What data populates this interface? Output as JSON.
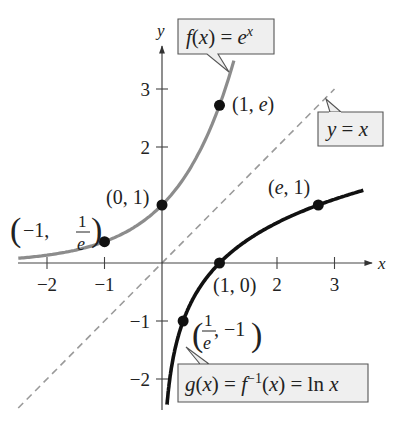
{
  "chart_data": {
    "type": "line",
    "title": "",
    "xlabel": "x",
    "ylabel": "y",
    "xlim": [
      -2.5,
      3.7
    ],
    "ylim": [
      -2.5,
      3.6
    ],
    "x_ticks": [
      {
        "value": -2,
        "label": "−2"
      },
      {
        "value": -1,
        "label": "−1"
      },
      {
        "value": 2,
        "label": "2"
      },
      {
        "value": 3,
        "label": "3"
      }
    ],
    "y_ticks": [
      {
        "value": 3,
        "label": "3"
      },
      {
        "value": 2,
        "label": "2"
      },
      {
        "value": -1,
        "label": "−1"
      },
      {
        "value": -2,
        "label": "−2"
      }
    ],
    "grid": false,
    "series": [
      {
        "name": "f(x) = e^x",
        "function": "exp",
        "domain": [
          -2.5,
          1.25
        ],
        "color": "#8c8c8c",
        "style": "solid",
        "label": {
          "pre": "f(x) = e",
          "sup": "x"
        }
      },
      {
        "name": "g(x) = f^-1(x) = ln x",
        "function": "ln",
        "domain": [
          0.087,
          3.5
        ],
        "color": "#111111",
        "style": "solid",
        "label": {
          "a": "g(x) = f",
          "sup": "−1",
          "b": "(x) = ln x"
        }
      },
      {
        "name": "y = x",
        "function": "identity",
        "domain": [
          -2.5,
          3.0
        ],
        "color": "#9a9a9a",
        "style": "dashed",
        "label": {
          "text": "y = x"
        }
      }
    ],
    "points": [
      {
        "x": -1,
        "y": 0.3679,
        "label": "(−1, 1/e)"
      },
      {
        "x": 0,
        "y": 1,
        "label": "(0, 1)"
      },
      {
        "x": 1,
        "y": 2.7183,
        "label": "(1, e)"
      },
      {
        "x": 1,
        "y": 0,
        "label": "(1, 0)"
      },
      {
        "x": 2.7183,
        "y": 1,
        "label": "(e, 1)"
      },
      {
        "x": 0.3679,
        "y": -1,
        "label": "(1/e, −1)"
      }
    ],
    "text": {
      "p_neg1": {
        "a": "−1,",
        "num": "1",
        "den": "e"
      },
      "p_01": "(0, 1)",
      "p_1e": "(1, e)",
      "p_10": "(1, 0)",
      "p_e1": "(e, 1)",
      "p_inv": {
        "num": "1",
        "den": "e",
        "b": ", −1"
      }
    },
    "legend": "callouts"
  }
}
